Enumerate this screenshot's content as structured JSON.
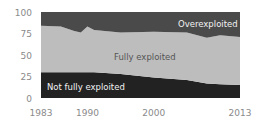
{
  "chart_data": {
    "type": "area",
    "stacked": true,
    "title": "",
    "xlabel": "",
    "ylabel": "",
    "ylim": [
      0,
      100
    ],
    "xlim": [
      1983,
      2013
    ],
    "grid": false,
    "legend": "inline labels",
    "x": [
      1983,
      1986,
      1988,
      1989,
      1990,
      1991,
      1995,
      2000,
      2005,
      2008,
      2010,
      2013
    ],
    "series": [
      {
        "name": "Not fully exploited",
        "color": "#222222",
        "values": [
          30,
          30,
          30,
          30,
          30,
          30,
          28,
          24,
          21,
          17,
          16,
          15
        ]
      },
      {
        "name": "Fully exploited",
        "color": "#bdbdbd",
        "values": [
          54,
          53,
          48,
          46,
          53,
          49,
          48,
          53,
          55,
          53,
          57,
          56
        ]
      },
      {
        "name": "Overexploited",
        "color": "#4a4a4a",
        "values": [
          16,
          17,
          22,
          24,
          17,
          21,
          24,
          23,
          24,
          30,
          27,
          29
        ]
      }
    ],
    "x_ticks": [
      "1983",
      "1990",
      "2000",
      "2013"
    ],
    "y_ticks": [
      "0",
      "25",
      "50",
      "75",
      "100"
    ],
    "annotations": {
      "overexploited": "Overexploited",
      "fully": "Fully exploited",
      "not_fully": "Not fully exploited"
    }
  }
}
